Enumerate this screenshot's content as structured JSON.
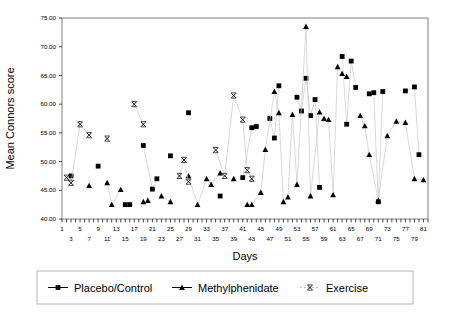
{
  "chart_data": {
    "type": "scatter",
    "title": "",
    "xlabel": "Days",
    "ylabel": "Mean Connors score",
    "xlim": [
      1,
      82
    ],
    "ylim": [
      40.0,
      75.0
    ],
    "yticks": [
      "40.00",
      "45.00",
      "50.00",
      "55.00",
      "60.00",
      "65.00",
      "70.00",
      "75.00"
    ],
    "ytick_values": [
      40,
      45,
      50,
      55,
      60,
      65,
      70,
      75
    ],
    "xticks_top_row": [
      1,
      5,
      9,
      13,
      17,
      21,
      25,
      29,
      33,
      37,
      41,
      45,
      49,
      53,
      57,
      61,
      65,
      69,
      73,
      77,
      81
    ],
    "xticks_bottom_row": [
      3,
      7,
      11,
      15,
      19,
      23,
      27,
      31,
      35,
      39,
      43,
      47,
      51,
      55,
      59,
      63,
      67,
      71,
      75,
      79
    ],
    "grid": false,
    "legend_position": "bottom",
    "series": [
      {
        "name": "Placebo/Control",
        "marker": "square",
        "color": "#000000",
        "points": [
          [
            3,
            47.5
          ],
          [
            9,
            49.2
          ],
          [
            15,
            42.5
          ],
          [
            16,
            42.5
          ],
          [
            19,
            52.8
          ],
          [
            22,
            47.0
          ],
          [
            21,
            45.2
          ],
          [
            25,
            51.0
          ],
          [
            29,
            58.5
          ],
          [
            36,
            44.0
          ],
          [
            41,
            47.2
          ],
          [
            43,
            55.9
          ],
          [
            44,
            56.1
          ],
          [
            47,
            57.5
          ],
          [
            49,
            63.2
          ],
          [
            48,
            54.1
          ],
          [
            53,
            61.2
          ],
          [
            54,
            58.8
          ],
          [
            55,
            64.5
          ],
          [
            57,
            60.8
          ],
          [
            56,
            58.0
          ],
          [
            58,
            45.5
          ],
          [
            63,
            68.3
          ],
          [
            65,
            67.5
          ],
          [
            66,
            62.9
          ],
          [
            64,
            56.5
          ],
          [
            69,
            61.8
          ],
          [
            70,
            62.0
          ],
          [
            72,
            62.2
          ],
          [
            71,
            43.0
          ],
          [
            77,
            62.3
          ],
          [
            79,
            63.0
          ],
          [
            80,
            51.2
          ]
        ]
      },
      {
        "name": "Methylphenidate",
        "marker": "triangle",
        "color": "#000000",
        "points": [
          [
            7,
            45.8
          ],
          [
            11,
            46.3
          ],
          [
            12,
            42.5
          ],
          [
            14,
            45.1
          ],
          [
            19,
            43.0
          ],
          [
            20,
            43.2
          ],
          [
            23,
            44.0
          ],
          [
            25,
            43.0
          ],
          [
            29,
            47.5
          ],
          [
            31,
            42.5
          ],
          [
            33,
            47.0
          ],
          [
            34,
            46.0
          ],
          [
            36,
            48.0
          ],
          [
            39,
            47.0
          ],
          [
            42,
            42.5
          ],
          [
            43,
            42.5
          ],
          [
            45,
            44.6
          ],
          [
            46,
            52.1
          ],
          [
            48,
            62.2
          ],
          [
            49,
            58.5
          ],
          [
            50,
            43.0
          ],
          [
            51,
            43.8
          ],
          [
            52,
            58.2
          ],
          [
            53,
            46.0
          ],
          [
            55,
            73.5
          ],
          [
            56,
            44.0
          ],
          [
            58,
            58.6
          ],
          [
            59,
            57.5
          ],
          [
            60,
            57.3
          ],
          [
            61,
            44.2
          ],
          [
            62,
            66.5
          ],
          [
            63,
            65.3
          ],
          [
            64,
            64.8
          ],
          [
            67,
            58.0
          ],
          [
            68,
            56.2
          ],
          [
            69,
            51.2
          ],
          [
            71,
            43.2
          ],
          [
            73,
            54.5
          ],
          [
            75,
            57.0
          ],
          [
            77,
            56.8
          ],
          [
            79,
            47.0
          ],
          [
            81,
            46.8
          ]
        ]
      },
      {
        "name": "Exercise",
        "marker": "x",
        "color": "#000000",
        "points": [
          [
            2,
            47.2
          ],
          [
            3,
            46.3
          ],
          [
            5,
            56.5
          ],
          [
            7,
            54.6
          ],
          [
            11,
            54.0
          ],
          [
            17,
            60.0
          ],
          [
            19,
            56.5
          ],
          [
            27,
            47.5
          ],
          [
            28,
            50.3
          ],
          [
            29,
            46.5
          ],
          [
            35,
            52.0
          ],
          [
            37,
            47.5
          ],
          [
            39,
            61.5
          ],
          [
            41,
            57.3
          ],
          [
            42,
            48.5
          ],
          [
            43,
            47.0
          ]
        ]
      }
    ]
  },
  "legend": {
    "items": [
      {
        "label": "Placebo/Control",
        "marker": "square"
      },
      {
        "label": "Methylphenidate",
        "marker": "triangle"
      },
      {
        "label": "Exercise",
        "marker": "x"
      }
    ]
  }
}
